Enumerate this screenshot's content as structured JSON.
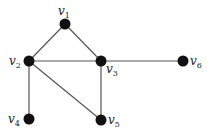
{
  "diagram": {
    "type": "undirected-graph",
    "node_color": "#111111",
    "edge_color": "#555555",
    "nodes": [
      {
        "id": "v1",
        "base": "v",
        "sub": "1",
        "x": 65,
        "y": 24,
        "lx": 58,
        "ly": 15
      },
      {
        "id": "v2",
        "base": "v",
        "sub": "2",
        "x": 29,
        "y": 61,
        "lx": 9,
        "ly": 65
      },
      {
        "id": "v3",
        "base": "v",
        "sub": "3",
        "x": 101,
        "y": 61,
        "lx": 106,
        "ly": 73
      },
      {
        "id": "v4",
        "base": "v",
        "sub": "4",
        "x": 29,
        "y": 119,
        "lx": 8,
        "ly": 123
      },
      {
        "id": "v5",
        "base": "v",
        "sub": "5",
        "x": 101,
        "y": 120,
        "lx": 108,
        "ly": 124
      },
      {
        "id": "v6",
        "base": "v",
        "sub": "6",
        "x": 183,
        "y": 61,
        "lx": 190,
        "ly": 65
      }
    ],
    "edges": [
      [
        "v1",
        "v2"
      ],
      [
        "v1",
        "v3"
      ],
      [
        "v2",
        "v3"
      ],
      [
        "v3",
        "v6"
      ],
      [
        "v2",
        "v4"
      ],
      [
        "v2",
        "v5"
      ],
      [
        "v3",
        "v5"
      ]
    ]
  }
}
